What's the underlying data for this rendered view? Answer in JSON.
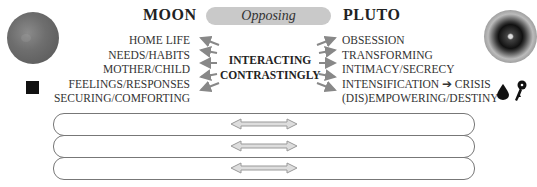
{
  "header": {
    "left_title": "MOON",
    "center_label": "Opposing",
    "right_title": "PLUTO"
  },
  "moon": {
    "keywords": [
      "HOME LIFE",
      "NEEDS/HABITS",
      "MOTHER/CHILD",
      "FEELINGS/RESPONSES",
      "SECURING/COMFORTING"
    ],
    "image_icon": "moon-icon",
    "glyph_icon": "black-square-icon"
  },
  "pluto": {
    "keywords": [
      "OBSESSION",
      "TRANSFORMING",
      "INTIMACY/SECRECY",
      "INTENSIFICATION ➔ CRISIS",
      "(DIS)EMPOWERING/DESTINY"
    ],
    "image_icon": "pluto-icon",
    "glyph_icons": [
      "drop-icon",
      "key-icon"
    ]
  },
  "center": {
    "line1": "INTERACTING",
    "line2": "CONTRASTINGLY"
  },
  "bars": [
    {
      "icon": "double-arrow-icon"
    },
    {
      "icon": "double-arrow-icon"
    },
    {
      "icon": "double-arrow-icon"
    }
  ],
  "colors": {
    "arrow": "#888888",
    "pill": "#c9c9c9",
    "text": "#333333"
  }
}
